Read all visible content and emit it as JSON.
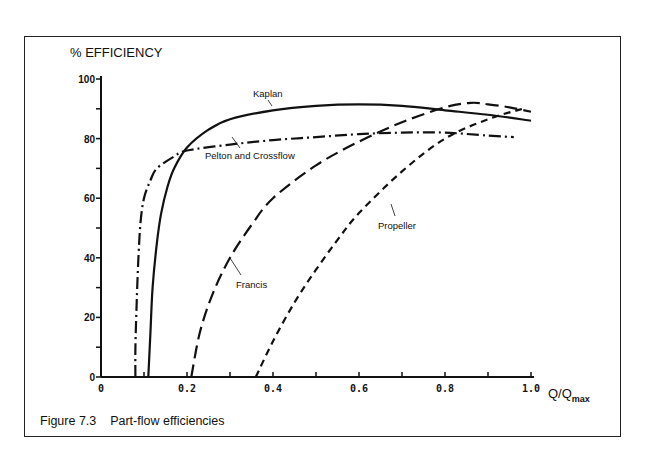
{
  "figure": {
    "caption": "Figure 7.3    Part-flow efficiencies"
  },
  "chart_data": {
    "type": "line",
    "title": "",
    "caption": "Figure 7.3 Part-flow efficiencies",
    "xlabel": "Q/Qmax",
    "xlabel_main": "Q/Q",
    "xlabel_sub": "max",
    "ylabel": "% EFFICIENCY",
    "xlim": [
      0,
      1.0
    ],
    "ylim": [
      0,
      100
    ],
    "xticks": [
      "0",
      "0.2",
      "0.4",
      "0.6",
      "0.8",
      "1.0"
    ],
    "yticks": [
      "0",
      "20",
      "40",
      "60",
      "80",
      "100"
    ],
    "grid": false,
    "legend": "inline annotations",
    "series": [
      {
        "name": "Kaplan",
        "style": "solid",
        "x": [
          0.11,
          0.115,
          0.12,
          0.13,
          0.14,
          0.155,
          0.17,
          0.2,
          0.25,
          0.3,
          0.4,
          0.5,
          0.6,
          0.7,
          0.8,
          0.9,
          1.0
        ],
        "y": [
          0,
          15,
          30,
          45,
          55,
          64,
          70,
          77,
          83,
          86.5,
          89.5,
          91,
          91.5,
          91,
          89.5,
          88,
          86
        ]
      },
      {
        "name": "Pelton and Crossflow",
        "style": "dash-dot",
        "x": [
          0.08,
          0.08,
          0.083,
          0.087,
          0.092,
          0.1,
          0.115,
          0.13,
          0.17,
          0.2,
          0.3,
          0.4,
          0.5,
          0.6,
          0.7,
          0.8,
          0.9,
          0.96
        ],
        "y": [
          0,
          10,
          25,
          40,
          52,
          60,
          66,
          70,
          74,
          76,
          78,
          79.5,
          80.5,
          81.5,
          82,
          82,
          81,
          80.5
        ]
      },
      {
        "name": "Francis",
        "style": "long-dash",
        "x": [
          0.21,
          0.23,
          0.26,
          0.3,
          0.35,
          0.4,
          0.5,
          0.6,
          0.7,
          0.8,
          0.86,
          0.9,
          0.95,
          1.0
        ],
        "y": [
          0,
          15,
          28,
          40,
          51,
          60,
          71,
          79,
          85.5,
          90.5,
          92,
          91.5,
          90.5,
          89
        ]
      },
      {
        "name": "Propeller",
        "style": "short-dash",
        "x": [
          0.36,
          0.4,
          0.45,
          0.5,
          0.55,
          0.6,
          0.7,
          0.8,
          0.9,
          0.98
        ],
        "y": [
          0,
          12,
          25,
          36,
          46,
          55,
          69,
          80,
          86.5,
          90
        ]
      }
    ],
    "annotations": [
      {
        "text": "Kaplan",
        "x": 0.44,
        "y": 95
      },
      {
        "text": "Pelton and Crossflow",
        "x": 0.19,
        "y": 73
      },
      {
        "text": "Francis",
        "x": 0.3,
        "y": 36
      },
      {
        "text": "Propeller",
        "x": 0.58,
        "y": 51
      }
    ]
  }
}
